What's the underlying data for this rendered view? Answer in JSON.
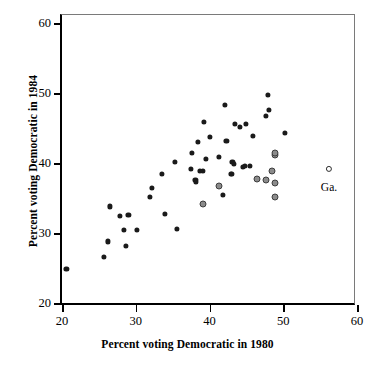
{
  "chart_data": {
    "type": "scatter",
    "title": "",
    "xlabel": "Percent voting Democratic in 1980",
    "ylabel": "Percent voting Democratic in 1984",
    "xlim": [
      20,
      60
    ],
    "ylim": [
      20,
      60
    ],
    "xticks": [
      20,
      30,
      40,
      50,
      60
    ],
    "yticks": [
      20,
      30,
      40,
      50,
      60
    ],
    "xticklabels": [
      "20",
      "30",
      "40",
      "50",
      "60"
    ],
    "yticklabels": [
      "20",
      "30",
      "40",
      "50",
      "60"
    ],
    "grid": false,
    "legend": null,
    "annotations": [
      {
        "text": "Ga.",
        "x": 56.2,
        "y": 37.5
      }
    ],
    "series": [
      {
        "name": "solid-points",
        "marker": "filled-circle",
        "color": "#1a1a1a",
        "points": [
          [
            20.6,
            24.9
          ],
          [
            25.7,
            26.6
          ],
          [
            26.2,
            28.8
          ],
          [
            26.5,
            33.8
          ],
          [
            27.9,
            32.4
          ],
          [
            28.4,
            30.5
          ],
          [
            28.7,
            28.2
          ],
          [
            29.0,
            32.6
          ],
          [
            30.2,
            30.5
          ],
          [
            31.9,
            35.1
          ],
          [
            32.2,
            36.5
          ],
          [
            33.6,
            38.4
          ],
          [
            34.0,
            32.7
          ],
          [
            35.3,
            40.1
          ],
          [
            35.6,
            30.6
          ],
          [
            37.5,
            39.1
          ],
          [
            37.6,
            41.4
          ],
          [
            38.1,
            37.6
          ],
          [
            38.2,
            37.3
          ],
          [
            38.4,
            43.0
          ],
          [
            38.7,
            38.9
          ],
          [
            39.1,
            38.9
          ],
          [
            39.2,
            45.9
          ],
          [
            39.5,
            40.6
          ],
          [
            40.1,
            43.7
          ],
          [
            41.3,
            40.9
          ],
          [
            41.8,
            35.4
          ],
          [
            42.1,
            48.3
          ],
          [
            42.3,
            43.1
          ],
          [
            42.9,
            38.5
          ],
          [
            43.0,
            38.4
          ],
          [
            43.1,
            40.1
          ],
          [
            43.3,
            39.9
          ],
          [
            43.4,
            45.6
          ],
          [
            44.1,
            45.1
          ],
          [
            44.5,
            39.4
          ],
          [
            44.8,
            39.6
          ],
          [
            44.9,
            45.6
          ],
          [
            45.5,
            39.6
          ],
          [
            45.9,
            43.9
          ],
          [
            47.7,
            46.7
          ],
          [
            47.9,
            49.7
          ],
          [
            48.1,
            47.6
          ],
          [
            50.2,
            44.3
          ]
        ]
      },
      {
        "name": "grey-points",
        "marker": "grey-circle",
        "color": "#8b8b8b",
        "points": [
          [
            39.1,
            34.2
          ],
          [
            41.3,
            36.7
          ],
          [
            46.5,
            37.7
          ],
          [
            47.6,
            37.6
          ],
          [
            48.5,
            38.8
          ],
          [
            48.9,
            41.1
          ],
          [
            48.9,
            41.5
          ],
          [
            48.9,
            37.1
          ],
          [
            48.9,
            35.1
          ]
        ]
      },
      {
        "name": "highlighted-point",
        "marker": "open-circle",
        "color": "#ffffff",
        "points": [
          [
            56.2,
            39.1
          ]
        ]
      }
    ]
  }
}
